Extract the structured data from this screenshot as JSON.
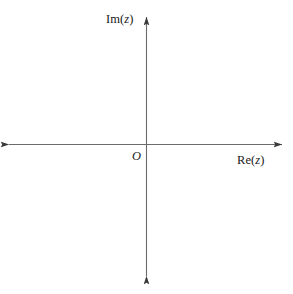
{
  "figure": {
    "kind": "diagram",
    "background_color": "#ffffff",
    "axis_color": "#6a6a6a",
    "text_color": "#1a1a1a",
    "width": 293,
    "height": 294
  },
  "labels": {
    "imaginary_axis": {
      "full": "Im(z)",
      "prefix": "Im(",
      "variable": "z",
      "suffix": ")"
    },
    "real_axis": {
      "full": "Re(z)",
      "prefix": "Re(",
      "variable": "z",
      "suffix": ")"
    },
    "origin": "O"
  },
  "geometry": {
    "origin": {
      "x": 146,
      "y": 144
    },
    "horizontal_axis": {
      "x1": 8,
      "y1": 144,
      "x2": 283,
      "y2": 144
    },
    "vertical_axis": {
      "x1": 146,
      "y1": 16,
      "x2": 146,
      "y2": 277
    },
    "arrowheads": [
      "left",
      "right",
      "up",
      "down"
    ]
  }
}
